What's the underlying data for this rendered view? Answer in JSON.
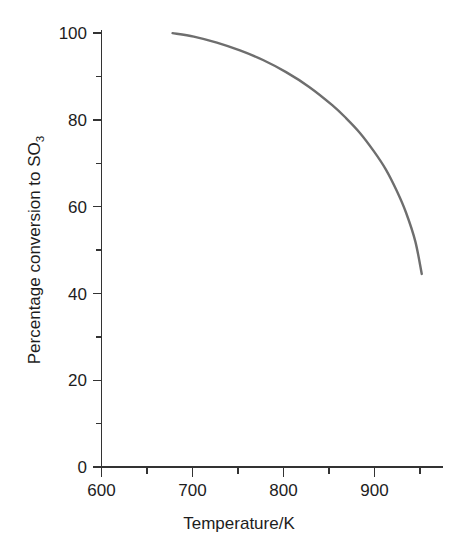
{
  "chart_data": {
    "type": "line",
    "title": "",
    "subtitle": "",
    "xlabel": "Temperature/K",
    "ylabel": "Percentage conversion to SO",
    "ylabel_subscript": "3",
    "xlim": [
      600,
      970
    ],
    "ylim": [
      0,
      100
    ],
    "grid": false,
    "legend": null,
    "x_major_ticks": [
      600,
      700,
      800,
      900
    ],
    "x_major_tick_labels": [
      "600",
      "700",
      "800",
      "900"
    ],
    "x_minor_ticks": [
      650,
      750,
      850,
      950
    ],
    "y_major_ticks": [
      0,
      20,
      40,
      60,
      80,
      100
    ],
    "y_major_tick_labels": [
      "0",
      "20",
      "40",
      "60",
      "80",
      "100"
    ],
    "y_minor_ticks": [
      10,
      30,
      50,
      70,
      90
    ],
    "series": [
      {
        "name": "Equilibrium conversion of SO2 to SO3",
        "color": "#6e6e6e",
        "line_width": 2.4,
        "x": [
          677,
          700,
          725,
          750,
          775,
          800,
          825,
          850,
          865,
          880,
          895,
          908,
          920,
          930,
          940,
          947
        ],
        "y": [
          100.0,
          99.2,
          97.8,
          96.0,
          93.8,
          91.0,
          87.6,
          83.4,
          80.4,
          77.0,
          72.8,
          68.6,
          63.6,
          58.6,
          52.0,
          44.5
        ]
      }
    ]
  },
  "colors": {
    "axis": "#333333",
    "text": "#1d1d1d",
    "curve": "#6e6e6e",
    "background": "#ffffff"
  },
  "labels": {
    "x_axis_title": "Temperature/K",
    "y_axis_title_main": "Percentage conversion to SO",
    "y_axis_title_sub": "3"
  }
}
